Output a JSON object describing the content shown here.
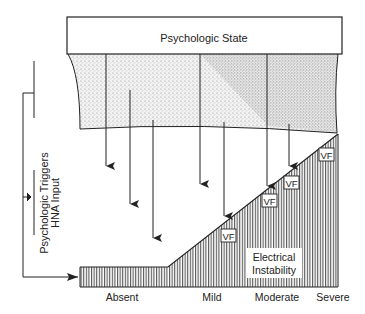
{
  "diagram": {
    "top_box": {
      "label": "Psychologic State"
    },
    "side_label": {
      "line1": "Psychologic Triggers",
      "line2": "HNA Input"
    },
    "region_label": {
      "line1": "Electrical",
      "line2": "Instability"
    },
    "vf_markers": [
      {
        "label": "VF"
      },
      {
        "label": "VF"
      },
      {
        "label": "VF"
      },
      {
        "label": "VF"
      }
    ],
    "x_axis_labels": [
      "Absent",
      "Mild",
      "Moderate",
      "Severe"
    ],
    "arrow_count": 7,
    "colors": {
      "ink": "#222222",
      "stipple": "#9a9a9a",
      "background": "#ffffff"
    }
  }
}
